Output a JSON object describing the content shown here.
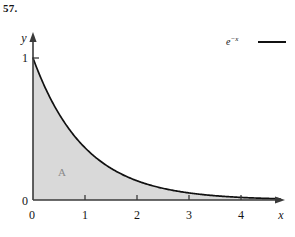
{
  "figure": {
    "problem_number": "57.",
    "region_label": "A",
    "curve_color": "#111111",
    "fill_color": "#d9d9d9",
    "axis_color": "#3a3a3a",
    "region_label_color": "#8a8a8a"
  },
  "axes": {
    "x_axis_name": "x",
    "y_axis_name": "y",
    "x_ticks": [
      "0",
      "1",
      "2",
      "3",
      "4"
    ],
    "y_ticks": [
      "0",
      "1"
    ]
  },
  "legend": {
    "base": "e",
    "exponent": "−x",
    "line_color": "#111111"
  },
  "chart_data": {
    "type": "line",
    "title": "",
    "subtitle": "",
    "xlabel": "x",
    "ylabel": "y",
    "xlim": [
      0,
      4.75
    ],
    "ylim": [
      0,
      1.12
    ],
    "grid": false,
    "legend_position": "top-right",
    "series": [
      {
        "name": "e^-x",
        "x": [
          0,
          0.25,
          0.5,
          0.75,
          1,
          1.25,
          1.5,
          1.75,
          2,
          2.25,
          2.5,
          2.75,
          3,
          3.25,
          3.5,
          3.75,
          4,
          4.25,
          4.5,
          4.75
        ],
        "values": [
          1,
          0.779,
          0.607,
          0.472,
          0.368,
          0.287,
          0.223,
          0.174,
          0.135,
          0.105,
          0.082,
          0.064,
          0.05,
          0.039,
          0.03,
          0.024,
          0.018,
          0.014,
          0.011,
          0.009
        ],
        "fill_to_zero": true,
        "fill_label": "A"
      }
    ],
    "xticks": [
      0,
      1,
      2,
      3,
      4
    ],
    "xticklabels": [
      "0",
      "1",
      "2",
      "3",
      "4"
    ],
    "yticks": [
      0,
      1
    ],
    "yticklabels": [
      "0",
      "1"
    ],
    "annotations": [
      {
        "text": "A",
        "x": 0.56,
        "y": 0.21
      },
      {
        "text": "e^-x",
        "x": 3.75,
        "y": 1.08
      }
    ]
  }
}
